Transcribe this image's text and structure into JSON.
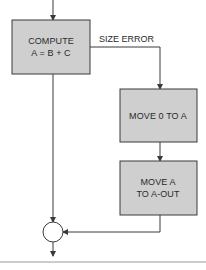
{
  "diagram": {
    "type": "flowchart",
    "colors": {
      "box_fill": "#cfcfcf",
      "box_stroke": "#3a3a3a",
      "line": "#3a3a3a",
      "background": "#ffffff"
    },
    "nodes": [
      {
        "id": "compute",
        "line1": "COMPUTE",
        "line2": "A = B + C"
      },
      {
        "id": "move-zero",
        "line1": "MOVE 0 TO A"
      },
      {
        "id": "move-out",
        "line1": "MOVE A",
        "line2": "TO A-OUT"
      },
      {
        "id": "connector",
        "shape": "circle"
      }
    ],
    "edges": [
      {
        "from": "entry",
        "to": "compute"
      },
      {
        "from": "compute",
        "to": "move-zero",
        "label": "SIZE ERROR"
      },
      {
        "from": "compute",
        "to": "connector"
      },
      {
        "from": "move-zero",
        "to": "move-out"
      },
      {
        "from": "move-out",
        "to": "connector"
      },
      {
        "from": "connector",
        "to": "exit"
      }
    ],
    "labels": {
      "size_error": "SIZE ERROR"
    }
  }
}
